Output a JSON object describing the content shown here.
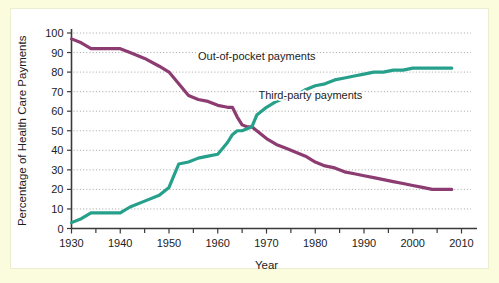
{
  "figure": {
    "background_color": "#fbfbdd",
    "plot_background_color": "#ffffff"
  },
  "chart_data": {
    "type": "line",
    "title": "",
    "subtitle": "",
    "xlabel": "Year",
    "ylabel": "Percentage of Health Care Payments",
    "xlim": [
      1930,
      2010
    ],
    "ylim": [
      0,
      100
    ],
    "x_ticks_major": [
      1930,
      1940,
      1950,
      1960,
      1970,
      1980,
      1990,
      2000,
      2010
    ],
    "x_ticks_minor": [
      1935,
      1945,
      1955,
      1965,
      1975,
      1985,
      1995,
      2005
    ],
    "x_tick_labels": [
      "1930",
      "1940",
      "1950",
      "1960",
      "1970",
      "1980",
      "1990",
      "2000",
      "2010"
    ],
    "y_ticks": [
      0,
      10,
      20,
      30,
      40,
      50,
      60,
      70,
      80,
      90,
      100
    ],
    "y_tick_labels": [
      "0",
      "10",
      "20",
      "30",
      "40",
      "50",
      "60",
      "70",
      "80",
      "90",
      "100"
    ],
    "grid": true,
    "grid_axis": "y",
    "grid_style": "dotted",
    "legend_position": "inline-annotation",
    "series": [
      {
        "name": "Out-of-pocket payments",
        "label": "Out-of-pocket payments",
        "color": "#8d3c72",
        "label_x": 1968,
        "label_y": 86,
        "x": [
          1930,
          1932,
          1934,
          1936,
          1940,
          1942,
          1945,
          1948,
          1950,
          1952,
          1954,
          1956,
          1958,
          1960,
          1962,
          1963,
          1964,
          1965,
          1966,
          1967,
          1968,
          1970,
          1972,
          1974,
          1976,
          1978,
          1980,
          1982,
          1984,
          1986,
          1988,
          1990,
          1992,
          1994,
          1996,
          1998,
          2000,
          2002,
          2004,
          2006,
          2008
        ],
        "y": [
          97,
          95,
          92,
          92,
          92,
          90,
          87,
          83,
          80,
          74,
          68,
          66,
          65,
          63,
          62,
          62,
          57,
          53,
          52,
          52,
          50,
          46,
          43,
          41,
          39,
          37,
          34,
          32,
          31,
          29,
          28,
          27,
          26,
          25,
          24,
          23,
          22,
          21,
          20,
          20,
          20
        ]
      },
      {
        "name": "Third-party payments",
        "label": "Third-party payments",
        "color": "#26a08b",
        "label_x": 1979,
        "label_y": 66,
        "x": [
          1930,
          1932,
          1934,
          1936,
          1940,
          1942,
          1945,
          1948,
          1950,
          1951,
          1952,
          1954,
          1956,
          1958,
          1960,
          1962,
          1963,
          1964,
          1965,
          1966,
          1967,
          1968,
          1970,
          1972,
          1974,
          1976,
          1978,
          1980,
          1982,
          1984,
          1986,
          1988,
          1990,
          1992,
          1994,
          1996,
          1998,
          2000,
          2002,
          2004,
          2006,
          2008
        ],
        "y": [
          3,
          5,
          8,
          8,
          8,
          11,
          14,
          17,
          21,
          27,
          33,
          34,
          36,
          37,
          38,
          44,
          48,
          50,
          50,
          51,
          52,
          58,
          62,
          65,
          67,
          68,
          71,
          73,
          74,
          76,
          77,
          78,
          79,
          80,
          80,
          81,
          81,
          82,
          82,
          82,
          82,
          82
        ]
      }
    ]
  }
}
